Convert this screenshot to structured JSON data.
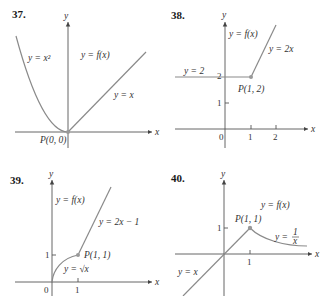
{
  "problems": [
    {
      "number": "37.",
      "axis_x_label": "x",
      "axis_y_label": "y",
      "curve_labels": [
        "y = x²",
        "y = f(x)",
        "y = x"
      ],
      "point_label": "P(0, 0)",
      "ticks_x": [],
      "ticks_y": []
    },
    {
      "number": "38.",
      "axis_x_label": "x",
      "axis_y_label": "y",
      "curve_labels": [
        "y = f(x)",
        "y = 2x",
        "y = 2"
      ],
      "point_label": "P(1, 2)",
      "origin_label": "0",
      "ticks_x": [
        "1",
        "2"
      ],
      "ticks_y": [
        "1",
        "2"
      ]
    },
    {
      "number": "39.",
      "axis_x_label": "x",
      "axis_y_label": "y",
      "curve_labels": [
        "y = f(x)",
        "y = 2x − 1",
        "y = √x"
      ],
      "point_label": "P(1, 1)",
      "origin_label": "0",
      "ticks_x": [
        "1"
      ],
      "ticks_y": [
        "1"
      ]
    },
    {
      "number": "40.",
      "axis_x_label": "x",
      "axis_y_label": "y",
      "curve_labels": [
        "y = f(x)",
        "y = 1/x",
        "y = x"
      ],
      "point_label": "P(1, 1)",
      "ticks_x": [
        "1"
      ],
      "ticks_y": [
        "1"
      ],
      "frac_num": "1",
      "frac_den": "x",
      "frac_prefix": "y ="
    }
  ],
  "colors": {
    "axis": "#555555",
    "curve": "#8a8a8a",
    "point": "#999999",
    "text": "#333333"
  }
}
